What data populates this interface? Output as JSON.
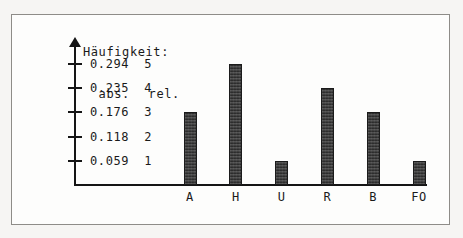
{
  "figure": {
    "heading_line1": "Häufigkeit:",
    "abs_label": "abs.",
    "rel_label": "rel."
  },
  "chart_data": {
    "type": "bar",
    "title": "Häufigkeit:",
    "xlabel": "",
    "ylabel": "abs. / rel.",
    "categories": [
      "A",
      "H",
      "U",
      "R",
      "B",
      "FO"
    ],
    "values": [
      3,
      5,
      1,
      4,
      3,
      1
    ],
    "relative_values": [
      0.176,
      0.294,
      0.059,
      0.235,
      0.176,
      0.059
    ],
    "ylim": [
      0,
      5.6
    ],
    "grid": false,
    "legend": null,
    "y_ticks_abs": [
      "5",
      "4",
      "3",
      "2",
      "1"
    ],
    "y_ticks_rel": [
      "0.294",
      "0.235",
      "0.176",
      "0.118",
      "0.059"
    ],
    "y_tick_values": [
      5,
      4,
      3,
      2,
      1
    ],
    "bar_color": "#2b2b2b",
    "axis_color": "#151515",
    "background_color": "#fdfdfc"
  }
}
